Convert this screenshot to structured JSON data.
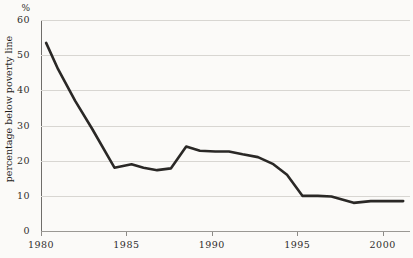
{
  "chart_data": {
    "type": "line",
    "title": "",
    "subtitle": "",
    "xlabel": "",
    "ylabel": "percentage below poverty line",
    "y_unit": "%",
    "xlim": [
      1980,
      2001.6
    ],
    "ylim": [
      0,
      60
    ],
    "grid": true,
    "legend": false,
    "x_ticks": [
      1980,
      1985,
      1990,
      1995,
      2000
    ],
    "x_tick_labels": [
      "1980",
      "1985",
      "1990",
      "1995",
      "2000"
    ],
    "y_ticks": [
      0,
      10,
      20,
      30,
      40,
      50,
      60
    ],
    "y_tick_labels": [
      "0",
      "10",
      "20",
      "30",
      "40",
      "50",
      "60"
    ],
    "series": [
      {
        "name": "percentage below poverty line",
        "color": "#2a2826",
        "line_width": 2.6,
        "x": [
          1980.3,
          1981.0,
          1982.0,
          1983.0,
          1984.3,
          1985.3,
          1986.0,
          1986.8,
          1987.6,
          1988.5,
          1989.3,
          1990.2,
          1991.0,
          1991.8,
          1992.7,
          1993.6,
          1994.4,
          1995.3,
          1996.2,
          1997.0,
          1998.3,
          1999.3,
          2000.3,
          2001.2
        ],
        "values": [
          53.5,
          46.0,
          37.0,
          29.0,
          18.0,
          19.0,
          18.0,
          17.3,
          17.8,
          24.0,
          22.8,
          22.6,
          22.6,
          21.8,
          21.0,
          19.0,
          16.0,
          10.0,
          10.0,
          9.8,
          8.0,
          8.5,
          8.5,
          8.5
        ]
      }
    ]
  },
  "axes": {
    "y_unit_label": "%",
    "y_title": "percentage below poverty line"
  },
  "colors": {
    "background": "#fbfaf8",
    "gridline": "#d8d6d2",
    "axis": "#6f6d6a",
    "baseline": "#9a9894",
    "series_line": "#2a2826",
    "text": "#2f2d2b"
  }
}
